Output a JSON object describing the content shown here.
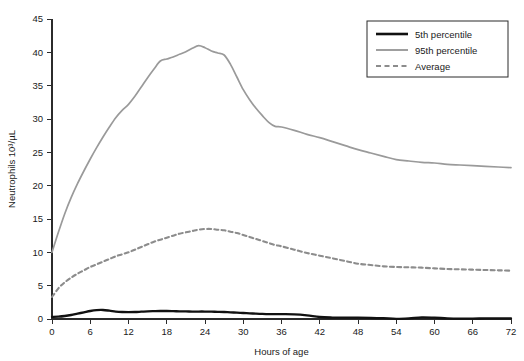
{
  "chart_data": {
    "type": "line",
    "title": "",
    "xlabel": "Hours of age",
    "ylabel": "Neutrophils 10³/µL",
    "xlim": [
      0,
      72
    ],
    "ylim": [
      0,
      45
    ],
    "xticks": [
      0,
      6,
      12,
      18,
      24,
      30,
      36,
      42,
      48,
      54,
      60,
      66,
      72
    ],
    "yticks": [
      0,
      5,
      10,
      15,
      20,
      25,
      30,
      35,
      40,
      45
    ],
    "xtick_labels": [
      "0",
      "6",
      "12",
      "18",
      "24",
      "30",
      "36",
      "42",
      "48",
      "54",
      "60",
      "66",
      "72"
    ],
    "ytick_labels": [
      "0",
      "5",
      "10",
      "15",
      "20",
      "25",
      "30",
      "35",
      "40",
      "45"
    ],
    "grid": false,
    "legend_position": "top-right",
    "x": [
      0,
      1,
      2,
      3,
      4,
      5,
      6,
      7,
      8,
      9,
      10,
      11,
      12,
      13,
      14,
      15,
      16,
      17,
      18,
      19,
      20,
      21,
      22,
      23,
      24,
      25,
      26,
      27,
      28,
      29,
      30,
      31,
      32,
      33,
      34,
      35,
      36,
      38,
      40,
      42,
      44,
      46,
      48,
      50,
      52,
      54,
      56,
      58,
      60,
      62,
      64,
      66,
      68,
      70,
      72
    ],
    "series": [
      {
        "name": "5th percentile",
        "color": "#111111",
        "style": "solid",
        "width": 2.3,
        "values": [
          0.3,
          0.35,
          0.45,
          0.6,
          0.8,
          1.0,
          1.2,
          1.33,
          1.35,
          1.25,
          1.12,
          1.05,
          1.03,
          1.05,
          1.1,
          1.15,
          1.18,
          1.2,
          1.2,
          1.18,
          1.15,
          1.13,
          1.12,
          1.12,
          1.12,
          1.1,
          1.08,
          1.05,
          1.0,
          0.95,
          0.9,
          0.85,
          0.8,
          0.76,
          0.73,
          0.72,
          0.72,
          0.7,
          0.55,
          0.3,
          0.22,
          0.2,
          0.2,
          0.18,
          0.12,
          0.03,
          0.1,
          0.25,
          0.2,
          0.1,
          0.06,
          0.07,
          0.08,
          0.09,
          0.1
        ]
      },
      {
        "name": "95th percentile",
        "color": "#9a9a9a",
        "style": "solid",
        "width": 1.7,
        "values": [
          10.0,
          13.0,
          15.8,
          18.2,
          20.3,
          22.2,
          24.0,
          25.7,
          27.3,
          28.8,
          30.2,
          31.3,
          32.2,
          33.4,
          34.8,
          36.2,
          37.5,
          38.7,
          39.0,
          39.3,
          39.7,
          40.1,
          40.6,
          41.0,
          40.7,
          40.2,
          39.9,
          39.6,
          38.2,
          36.3,
          34.4,
          32.9,
          31.6,
          30.5,
          29.5,
          28.9,
          28.8,
          28.3,
          27.7,
          27.2,
          26.6,
          26.0,
          25.4,
          24.9,
          24.4,
          23.9,
          23.7,
          23.5,
          23.4,
          23.2,
          23.1,
          23.0,
          22.9,
          22.8,
          22.7
        ]
      },
      {
        "name": "Average",
        "color": "#8c8c8c",
        "style": "dashed",
        "width": 2.1,
        "values": [
          3.3,
          4.6,
          5.5,
          6.2,
          6.8,
          7.3,
          7.8,
          8.2,
          8.6,
          9.0,
          9.4,
          9.7,
          10.0,
          10.4,
          10.8,
          11.2,
          11.6,
          11.9,
          12.2,
          12.5,
          12.8,
          13.0,
          13.2,
          13.4,
          13.5,
          13.5,
          13.4,
          13.3,
          13.1,
          12.9,
          12.6,
          12.3,
          12.0,
          11.7,
          11.4,
          11.1,
          10.9,
          10.4,
          9.9,
          9.5,
          9.1,
          8.7,
          8.3,
          8.1,
          7.9,
          7.8,
          7.75,
          7.7,
          7.6,
          7.5,
          7.45,
          7.4,
          7.35,
          7.3,
          7.25
        ]
      }
    ],
    "legend_entries": [
      {
        "label": "5th percentile",
        "color": "#111111",
        "style": "solid"
      },
      {
        "label": "95th percentile",
        "color": "#9a9a9a",
        "style": "solid"
      },
      {
        "label": "Average",
        "color": "#8c8c8c",
        "style": "dashed"
      }
    ]
  }
}
